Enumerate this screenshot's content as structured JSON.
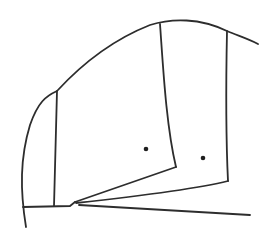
{
  "figure": {
    "canvas": {
      "width": 279,
      "height": 239,
      "background": "#ffffff"
    },
    "stroke": {
      "color": "#2d2d2d",
      "width": 1.8
    },
    "dot_color": "#1f1f1f",
    "paths": [
      {
        "name": "outer-arc",
        "d": "M 26 227 C 20 190 20 158 30 125 C 38 102 46 96 57 91 C 80 66 112 40 150 25 C 172 18 200 18 227 31 C 239 36 249 39 258 44"
      },
      {
        "name": "left-chord",
        "d": "M 57 91 L 54 206"
      },
      {
        "name": "middle-chord",
        "d": "M 160 24 C 163 65 166 125 176 167"
      },
      {
        "name": "right-chord",
        "d": "M 227 31 C 226 80 226 140 228 181"
      },
      {
        "name": "middle-blade-lower-edge",
        "d": "M 176 167 L 75 202"
      },
      {
        "name": "right-blade-lower-edge",
        "d": "M 228 181 C 200 188 140 196 76 203"
      },
      {
        "name": "baseline-left-segment",
        "d": "M 23 207 L 70 206 L 75 202"
      },
      {
        "name": "long-bottom-line",
        "d": "M 79 205 L 250 215"
      }
    ],
    "dots": [
      {
        "name": "marked-point-left",
        "cx": 146,
        "cy": 149,
        "r": 2.3
      },
      {
        "name": "marked-point-right",
        "cx": 203,
        "cy": 158,
        "r": 2.3
      }
    ]
  }
}
